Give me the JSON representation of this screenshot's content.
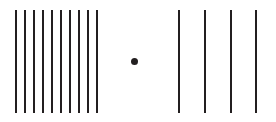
{
  "figure": {
    "width": 276,
    "height": 122,
    "background_color": "#ffffff",
    "stroke_color": "#231f20"
  },
  "chart_data": {
    "type": "scatter",
    "xlabel": "",
    "ylabel": "",
    "xlim": [
      0,
      276
    ],
    "ylim": [
      0,
      122
    ],
    "grid": false,
    "legend": "none",
    "series": [
      {
        "name": "left-dense-group",
        "element": "vertical-line",
        "count": 10,
        "line_width": 2,
        "y_top": 10,
        "y_bottom": 113,
        "x": [
          16,
          25,
          34,
          43,
          52,
          61,
          70,
          79,
          88,
          97
        ]
      },
      {
        "name": "right-sparse-group",
        "element": "vertical-line",
        "count": 4,
        "line_width": 2,
        "y_top": 10,
        "y_bottom": 113,
        "x": [
          179,
          205,
          231,
          256
        ]
      },
      {
        "name": "center-dot",
        "element": "dot",
        "count": 1,
        "radius": 3.5,
        "x": [
          134
        ],
        "y": [
          61
        ]
      }
    ]
  },
  "elements": {
    "left_group_label": "Left dense line group",
    "right_group_label": "Right sparse line group",
    "dot_label": "Center reference dot"
  }
}
